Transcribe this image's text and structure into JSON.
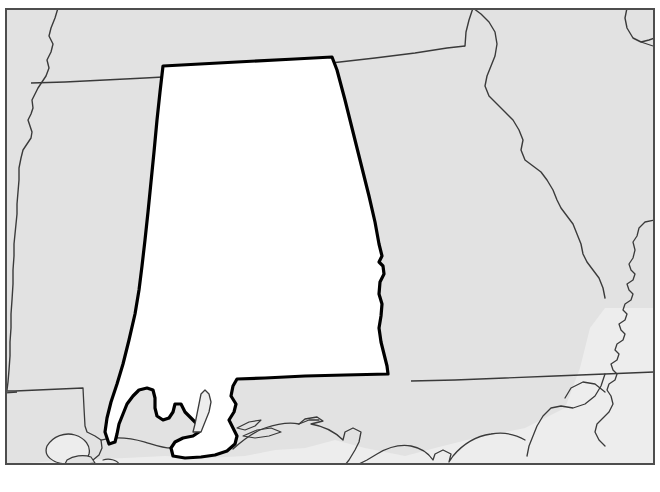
{
  "page": {
    "page_number": "57",
    "copyright": "© Aquinas Learning LLC 20",
    "background_color": "#ffffff"
  },
  "map": {
    "title": "Alabama Outline Map",
    "type": "blank-outline-political-map",
    "frame": {
      "x": 5,
      "y": 8,
      "width": 650,
      "height": 457,
      "border_color": "#4d4d4d",
      "border_width": 2
    },
    "colors": {
      "land_fill": "#e2e2e2",
      "highlight_fill": "#ffffff",
      "water_fill": "#ededed",
      "state_border": "#3a3a3a",
      "highlight_border": "#000000",
      "coastline": "#3a3a3a"
    },
    "highlighted_state": {
      "name": "Alabama",
      "fill": "#ffffff",
      "stroke": "#000000",
      "stroke_width": 3.2
    },
    "neighbors": [
      {
        "name": "Mississippi",
        "position": "west"
      },
      {
        "name": "Tennessee",
        "position": "north"
      },
      {
        "name": "Georgia",
        "position": "east"
      },
      {
        "name": "Florida",
        "position": "southeast"
      },
      {
        "name": "Louisiana",
        "position": "southwest"
      },
      {
        "name": "South Carolina",
        "position": "far-east"
      },
      {
        "name": "North Carolina",
        "position": "far-northeast"
      }
    ],
    "water_bodies": [
      {
        "name": "Gulf of Mexico",
        "position": "south"
      },
      {
        "name": "Mobile Bay",
        "position": "south-central"
      },
      {
        "name": "Lake Pontchartrain",
        "position": "southwest"
      },
      {
        "name": "Atlantic Ocean",
        "position": "southeast"
      }
    ],
    "labels_shown": false
  }
}
